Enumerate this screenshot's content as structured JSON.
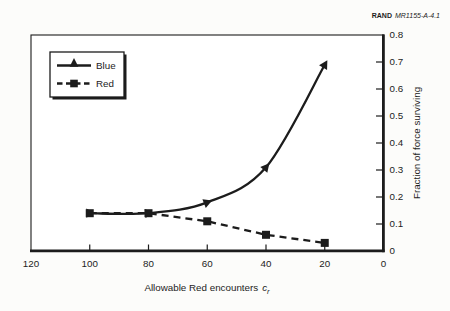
{
  "figure_label": {
    "brand": "RAND",
    "doc": "MR1155-A-4.1"
  },
  "colors": {
    "ink": "#1c1c1c",
    "paper": "#fcfcfa",
    "plot_bg": "#ffffff"
  },
  "legend": {
    "entries": [
      {
        "label": "Blue",
        "line": "solid",
        "marker": "triangle"
      },
      {
        "label": "Red",
        "line": "dashed",
        "marker": "square"
      }
    ],
    "position": "top-left"
  },
  "chart_data": {
    "type": "line",
    "title": "",
    "xlabel_main": "Allowable Red encounters",
    "xlabel_var": "c",
    "xlabel_sub": "r",
    "ylabel": "Fraction of force surviving",
    "x_range": [
      120,
      0
    ],
    "y_range": [
      0,
      0.8
    ],
    "x_axis_reversed": true,
    "grid": false,
    "x_ticks": [
      120,
      100,
      80,
      60,
      40,
      20,
      0
    ],
    "y_ticks": [
      0,
      0.1,
      0.2,
      0.3,
      0.4,
      0.5,
      0.6,
      0.7,
      0.8
    ],
    "x": [
      100,
      80,
      60,
      40,
      20
    ],
    "series": [
      {
        "name": "Blue",
        "marker": "triangle",
        "line": "solid",
        "values": [
          0.14,
          0.14,
          0.18,
          0.31,
          0.69
        ]
      },
      {
        "name": "Red",
        "marker": "square",
        "line": "dashed",
        "values": [
          0.14,
          0.14,
          0.11,
          0.06,
          0.03
        ]
      }
    ]
  }
}
